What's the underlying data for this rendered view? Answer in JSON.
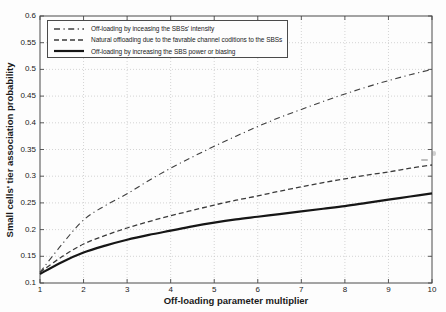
{
  "figure": {
    "background": "#fdfdfd",
    "border_color": "#4a4a4a",
    "grid_color": "#c9c9c9",
    "tick_color": "#4a4a4a",
    "text_color": "#1a1a1a"
  },
  "chart_data": {
    "type": "line",
    "title": "",
    "xlabel": "Off-loading parameter multiplier",
    "ylabel": "Small cells' tier association probability",
    "xlim": [
      1,
      10
    ],
    "ylim": [
      0.1,
      0.6
    ],
    "x_ticks": [
      1,
      2,
      3,
      4,
      5,
      6,
      7,
      8,
      9,
      10
    ],
    "y_ticks": [
      0.1,
      0.15,
      0.2,
      0.25,
      0.3,
      0.35,
      0.4,
      0.45,
      0.5,
      0.55,
      0.6
    ],
    "y_tick_labels": [
      "0.1",
      "0.15",
      "0.2",
      "0.25",
      "0.3",
      "0.35",
      "0.4",
      "0.45",
      "0.5",
      "0.55",
      "0.6"
    ],
    "grid": "dotted",
    "legend_position": "upper-left",
    "x": [
      1,
      1.5,
      2,
      2.5,
      3,
      3.5,
      4,
      4.5,
      5,
      5.5,
      6,
      6.5,
      7,
      7.5,
      8,
      8.5,
      9,
      9.5,
      10
    ],
    "series": [
      {
        "name": "Off-loading by inceasing the SBSs' intensity",
        "style": "dash-dot",
        "color": "#3f3f3f",
        "width": 1.1,
        "values": [
          0.12,
          0.172,
          0.218,
          0.245,
          0.267,
          0.292,
          0.315,
          0.336,
          0.356,
          0.375,
          0.393,
          0.41,
          0.425,
          0.44,
          0.454,
          0.467,
          0.479,
          0.49,
          0.5
        ]
      },
      {
        "name": "Natural offloading due to the favrable channel coditions to the SBSs",
        "style": "dashed",
        "color": "#3a3a3a",
        "width": 1.3,
        "values": [
          0.12,
          0.149,
          0.173,
          0.189,
          0.203,
          0.215,
          0.226,
          0.236,
          0.246,
          0.255,
          0.263,
          0.272,
          0.28,
          0.288,
          0.295,
          0.302,
          0.308,
          0.315,
          0.321
        ]
      },
      {
        "name": "Off-loading by increasing the SBS power or biasing",
        "style": "solid",
        "color": "#161616",
        "width": 2.2,
        "values": [
          0.117,
          0.139,
          0.157,
          0.17,
          0.181,
          0.19,
          0.198,
          0.206,
          0.213,
          0.219,
          0.224,
          0.229,
          0.234,
          0.239,
          0.244,
          0.25,
          0.256,
          0.262,
          0.268
        ]
      }
    ]
  }
}
